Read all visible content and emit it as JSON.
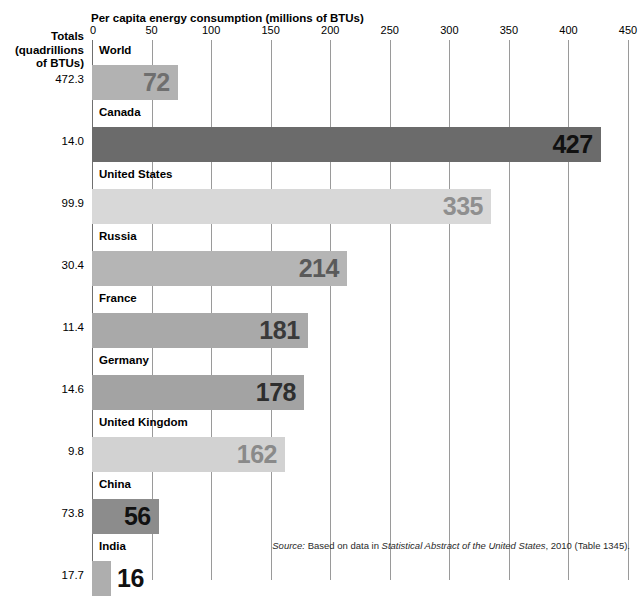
{
  "axis_title": "Per capita energy consumption (millions of BTUs)",
  "totals_header": [
    "Totals",
    "(quadrillions",
    "of BTUs)"
  ],
  "source": {
    "prefix": "Source:",
    "lead": " Based on data in ",
    "title": "Statistical Abstract of the United States",
    "suffix": ", 2010 (Table 1345)."
  },
  "colors": {
    "bar_world": "#b2b2b2",
    "bar_canada": "#6b6b6b",
    "bar_united_states": "#d8d8d8",
    "bar_russia": "#b5b5b5",
    "bar_france": "#a9a9a9",
    "bar_germany": "#a3a3a3",
    "bar_united_kingdom": "#d2d2d2",
    "bar_china": "#8c8c8c",
    "bar_india": "#aeaeae",
    "gridline": "#9a9a9a",
    "axis": "#6f6f6f",
    "value_label_dark": "#1a1a1a",
    "value_label_mid": "#4d4d4d",
    "value_label_light": "#7a7a7a"
  },
  "chart_data": {
    "type": "bar",
    "orientation": "horizontal",
    "title": "Per capita energy consumption (millions of BTUs)",
    "xlabel": "Per capita energy consumption (millions of BTUs)",
    "ylabel": "",
    "xlim": [
      0,
      450
    ],
    "xticks": [
      0,
      50,
      100,
      150,
      200,
      250,
      300,
      350,
      400,
      450
    ],
    "xtick_labels": [
      "0",
      "50",
      "100",
      "150",
      "200",
      "250",
      "300",
      "350",
      "400",
      "450"
    ],
    "grid": true,
    "legend": "none",
    "categories": [
      "World",
      "Canada",
      "United States",
      "Russia",
      "France",
      "Germany",
      "United Kingdom",
      "China",
      "India"
    ],
    "values": [
      72,
      427,
      335,
      214,
      181,
      178,
      162,
      56,
      16
    ],
    "value_labels": [
      "72",
      "427",
      "335",
      "214",
      "181",
      "178",
      "162",
      "56",
      "16"
    ],
    "secondary_series": {
      "name": "Totals (quadrillions of BTUs)",
      "values": [
        472.3,
        14.0,
        99.9,
        30.4,
        11.4,
        14.6,
        9.8,
        73.8,
        17.7
      ],
      "labels": [
        "472.3",
        "14.0",
        "99.9",
        "30.4",
        "11.4",
        "14.6",
        "9.8",
        "73.8",
        "17.7"
      ]
    },
    "rows": [
      {
        "label": "World",
        "value": 72,
        "value_label": "72",
        "total": "472.3",
        "bar_color": "#b2b2b2",
        "label_color": "#6f6f6f",
        "label_inside": true
      },
      {
        "label": "Canada",
        "value": 427,
        "value_label": "427",
        "total": "14.0",
        "bar_color": "#6b6b6b",
        "label_color": "#111111",
        "label_inside": true
      },
      {
        "label": "United States",
        "value": 335,
        "value_label": "335",
        "total": "99.9",
        "bar_color": "#d8d8d8",
        "label_color": "#8f8f8f",
        "label_inside": true
      },
      {
        "label": "Russia",
        "value": 214,
        "value_label": "214",
        "total": "30.4",
        "bar_color": "#b5b5b5",
        "label_color": "#5a5a5a",
        "label_inside": true
      },
      {
        "label": "France",
        "value": 181,
        "value_label": "181",
        "total": "11.4",
        "bar_color": "#a9a9a9",
        "label_color": "#3a3a3a",
        "label_inside": true
      },
      {
        "label": "Germany",
        "value": 178,
        "value_label": "178",
        "total": "14.6",
        "bar_color": "#a3a3a3",
        "label_color": "#2e2e2e",
        "label_inside": true
      },
      {
        "label": "United Kingdom",
        "value": 162,
        "value_label": "162",
        "total": "9.8",
        "bar_color": "#d2d2d2",
        "label_color": "#8a8a8a",
        "label_inside": true
      },
      {
        "label": "China",
        "value": 56,
        "value_label": "56",
        "total": "73.8",
        "bar_color": "#8c8c8c",
        "label_color": "#111111",
        "label_inside": true
      },
      {
        "label": "India",
        "value": 16,
        "value_label": "16",
        "total": "17.7",
        "bar_color": "#aeaeae",
        "label_color": "#111111",
        "label_inside": false
      }
    ]
  }
}
